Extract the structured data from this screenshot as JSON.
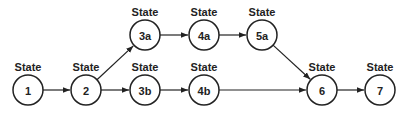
{
  "diagram": {
    "type": "state-transition-graph",
    "nodes": [
      {
        "id": "1",
        "label": "State",
        "text": "1",
        "x": 28,
        "y": 90
      },
      {
        "id": "2",
        "label": "State",
        "text": "2",
        "x": 86,
        "y": 90
      },
      {
        "id": "3a",
        "label": "State",
        "text": "3a",
        "x": 145,
        "y": 35
      },
      {
        "id": "3b",
        "label": "State",
        "text": "3b",
        "x": 145,
        "y": 90
      },
      {
        "id": "4a",
        "label": "State",
        "text": "4a",
        "x": 204,
        "y": 35
      },
      {
        "id": "4b",
        "label": "State",
        "text": "4b",
        "x": 204,
        "y": 90
      },
      {
        "id": "5a",
        "label": "State",
        "text": "5a",
        "x": 262,
        "y": 35
      },
      {
        "id": "6",
        "label": "State",
        "text": "6",
        "x": 322,
        "y": 90
      },
      {
        "id": "7",
        "label": "State",
        "text": "7",
        "x": 380,
        "y": 90
      }
    ],
    "edges": [
      {
        "from": "1",
        "to": "2"
      },
      {
        "from": "2",
        "to": "3a"
      },
      {
        "from": "2",
        "to": "3b"
      },
      {
        "from": "3a",
        "to": "4a"
      },
      {
        "from": "3b",
        "to": "4b"
      },
      {
        "from": "4a",
        "to": "5a"
      },
      {
        "from": "5a",
        "to": "6"
      },
      {
        "from": "4b",
        "to": "6"
      },
      {
        "from": "6",
        "to": "7"
      }
    ],
    "colors": {
      "stroke": "#222222",
      "fill": "#ffffff",
      "background": "#ffffff"
    }
  }
}
